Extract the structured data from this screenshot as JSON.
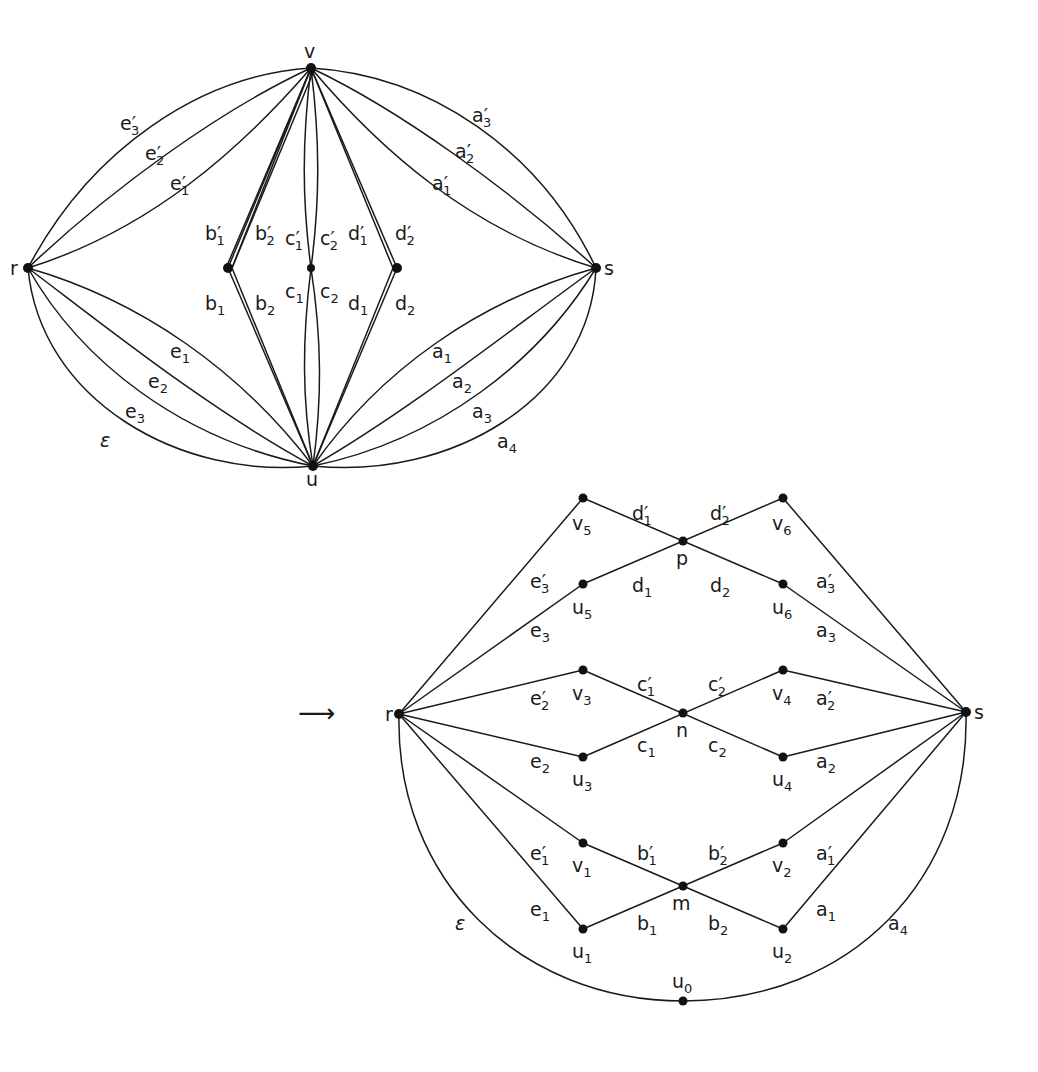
{
  "figure": {
    "left_graph": {
      "nodes": {
        "v": {
          "label": "v",
          "x": 311,
          "y": 68
        },
        "r": {
          "label": "r",
          "x": 28,
          "y": 268
        },
        "s": {
          "label": "s",
          "x": 596,
          "y": 268
        },
        "u": {
          "label": "u",
          "x": 313,
          "y": 466
        },
        "b": {
          "x": 228,
          "y": 268
        },
        "c": {
          "x": 311,
          "y": 268
        },
        "d": {
          "x": 397,
          "y": 268
        }
      },
      "edge_labels": [
        {
          "base": "e",
          "prime": true,
          "sub": "3",
          "x": 120,
          "y": 130
        },
        {
          "base": "e",
          "prime": true,
          "sub": "2",
          "x": 145,
          "y": 160
        },
        {
          "base": "e",
          "prime": true,
          "sub": "1",
          "x": 170,
          "y": 190
        },
        {
          "base": "a",
          "prime": true,
          "sub": "3",
          "x": 472,
          "y": 122
        },
        {
          "base": "a",
          "prime": true,
          "sub": "2",
          "x": 455,
          "y": 158
        },
        {
          "base": "a",
          "prime": true,
          "sub": "1",
          "x": 432,
          "y": 190
        },
        {
          "base": "b",
          "prime": true,
          "sub": "1",
          "x": 205,
          "y": 240
        },
        {
          "base": "b",
          "prime": true,
          "sub": "2",
          "x": 255,
          "y": 240
        },
        {
          "base": "c",
          "prime": true,
          "sub": "1",
          "x": 285,
          "y": 245
        },
        {
          "base": "c",
          "prime": true,
          "sub": "2",
          "x": 320,
          "y": 245
        },
        {
          "base": "d",
          "prime": true,
          "sub": "1",
          "x": 348,
          "y": 240
        },
        {
          "base": "d",
          "prime": true,
          "sub": "2",
          "x": 395,
          "y": 240
        },
        {
          "base": "b",
          "prime": false,
          "sub": "1",
          "x": 205,
          "y": 310
        },
        {
          "base": "b",
          "prime": false,
          "sub": "2",
          "x": 255,
          "y": 310
        },
        {
          "base": "c",
          "prime": false,
          "sub": "1",
          "x": 285,
          "y": 298
        },
        {
          "base": "c",
          "prime": false,
          "sub": "2",
          "x": 320,
          "y": 298
        },
        {
          "base": "d",
          "prime": false,
          "sub": "1",
          "x": 348,
          "y": 310
        },
        {
          "base": "d",
          "prime": false,
          "sub": "2",
          "x": 395,
          "y": 310
        },
        {
          "base": "e",
          "prime": false,
          "sub": "1",
          "x": 170,
          "y": 358
        },
        {
          "base": "e",
          "prime": false,
          "sub": "2",
          "x": 148,
          "y": 388
        },
        {
          "base": "e",
          "prime": false,
          "sub": "3",
          "x": 125,
          "y": 418
        },
        {
          "base": "ε",
          "prime": false,
          "sub": "",
          "x": 100,
          "y": 447
        },
        {
          "base": "a",
          "prime": false,
          "sub": "1",
          "x": 432,
          "y": 358
        },
        {
          "base": "a",
          "prime": false,
          "sub": "2",
          "x": 452,
          "y": 388
        },
        {
          "base": "a",
          "prime": false,
          "sub": "3",
          "x": 472,
          "y": 418
        },
        {
          "base": "a",
          "prime": false,
          "sub": "4",
          "x": 497,
          "y": 448
        }
      ]
    },
    "arrow": {
      "glyph": "⟶",
      "x": 298,
      "y": 722
    },
    "right_graph": {
      "nodes": [
        {
          "id": "r",
          "label": "r",
          "sub": "",
          "x": 399,
          "y": 714,
          "lx": 385,
          "ly": 721
        },
        {
          "id": "s",
          "label": "s",
          "sub": "",
          "x": 966,
          "y": 712,
          "lx": 974,
          "ly": 719
        },
        {
          "id": "v5",
          "label": "v",
          "sub": "5",
          "x": 583,
          "y": 498,
          "lx": 572,
          "ly": 530
        },
        {
          "id": "v6",
          "label": "v",
          "sub": "6",
          "x": 783,
          "y": 498,
          "lx": 772,
          "ly": 530
        },
        {
          "id": "p",
          "label": "p",
          "sub": "",
          "x": 683,
          "y": 541,
          "lx": 676,
          "ly": 565
        },
        {
          "id": "u5",
          "label": "u",
          "sub": "5",
          "x": 583,
          "y": 584,
          "lx": 572,
          "ly": 614
        },
        {
          "id": "u6",
          "label": "u",
          "sub": "6",
          "x": 783,
          "y": 584,
          "lx": 772,
          "ly": 614
        },
        {
          "id": "v3",
          "label": "v",
          "sub": "3",
          "x": 583,
          "y": 670,
          "lx": 572,
          "ly": 700
        },
        {
          "id": "v4",
          "label": "v",
          "sub": "4",
          "x": 783,
          "y": 670,
          "lx": 772,
          "ly": 700
        },
        {
          "id": "n",
          "label": "n",
          "sub": "",
          "x": 683,
          "y": 713,
          "lx": 676,
          "ly": 737
        },
        {
          "id": "u3",
          "label": "u",
          "sub": "3",
          "x": 583,
          "y": 757,
          "lx": 572,
          "ly": 786
        },
        {
          "id": "u4",
          "label": "u",
          "sub": "4",
          "x": 783,
          "y": 757,
          "lx": 772,
          "ly": 786
        },
        {
          "id": "v1",
          "label": "v",
          "sub": "1",
          "x": 583,
          "y": 843,
          "lx": 572,
          "ly": 872
        },
        {
          "id": "v2",
          "label": "v",
          "sub": "2",
          "x": 783,
          "y": 843,
          "lx": 772,
          "ly": 872
        },
        {
          "id": "m",
          "label": "m",
          "sub": "",
          "x": 683,
          "y": 886,
          "lx": 672,
          "ly": 910
        },
        {
          "id": "u1",
          "label": "u",
          "sub": "1",
          "x": 583,
          "y": 929,
          "lx": 572,
          "ly": 958
        },
        {
          "id": "u2",
          "label": "u",
          "sub": "2",
          "x": 783,
          "y": 929,
          "lx": 772,
          "ly": 958
        },
        {
          "id": "u0",
          "label": "u",
          "sub": "0",
          "x": 683,
          "y": 1001,
          "lx": 672,
          "ly": 988
        }
      ],
      "edge_labels": [
        {
          "base": "d",
          "prime": true,
          "sub": "1",
          "x": 632,
          "y": 520
        },
        {
          "base": "d",
          "prime": true,
          "sub": "2",
          "x": 710,
          "y": 520
        },
        {
          "base": "d",
          "prime": false,
          "sub": "1",
          "x": 632,
          "y": 592
        },
        {
          "base": "d",
          "prime": false,
          "sub": "2",
          "x": 710,
          "y": 592
        },
        {
          "base": "e",
          "prime": true,
          "sub": "3",
          "x": 530,
          "y": 588
        },
        {
          "base": "e",
          "prime": false,
          "sub": "3",
          "x": 530,
          "y": 637
        },
        {
          "base": "a",
          "prime": true,
          "sub": "3",
          "x": 816,
          "y": 588
        },
        {
          "base": "a",
          "prime": false,
          "sub": "3",
          "x": 816,
          "y": 637
        },
        {
          "base": "c",
          "prime": true,
          "sub": "1",
          "x": 637,
          "y": 691
        },
        {
          "base": "c",
          "prime": true,
          "sub": "2",
          "x": 708,
          "y": 691
        },
        {
          "base": "e",
          "prime": true,
          "sub": "2",
          "x": 530,
          "y": 705
        },
        {
          "base": "a",
          "prime": true,
          "sub": "2",
          "x": 816,
          "y": 705
        },
        {
          "base": "c",
          "prime": false,
          "sub": "1",
          "x": 637,
          "y": 752
        },
        {
          "base": "c",
          "prime": false,
          "sub": "2",
          "x": 708,
          "y": 752
        },
        {
          "base": "e",
          "prime": false,
          "sub": "2",
          "x": 530,
          "y": 768
        },
        {
          "base": "a",
          "prime": false,
          "sub": "2",
          "x": 816,
          "y": 768
        },
        {
          "base": "e",
          "prime": true,
          "sub": "1",
          "x": 530,
          "y": 860
        },
        {
          "base": "a",
          "prime": true,
          "sub": "1",
          "x": 816,
          "y": 860
        },
        {
          "base": "b",
          "prime": true,
          "sub": "1",
          "x": 637,
          "y": 860
        },
        {
          "base": "b",
          "prime": true,
          "sub": "2",
          "x": 708,
          "y": 860
        },
        {
          "base": "e",
          "prime": false,
          "sub": "1",
          "x": 530,
          "y": 916
        },
        {
          "base": "a",
          "prime": false,
          "sub": "1",
          "x": 816,
          "y": 916
        },
        {
          "base": "b",
          "prime": false,
          "sub": "1",
          "x": 637,
          "y": 930
        },
        {
          "base": "b",
          "prime": false,
          "sub": "2",
          "x": 708,
          "y": 930
        },
        {
          "base": "ε",
          "prime": false,
          "sub": "",
          "x": 455,
          "y": 930
        },
        {
          "base": "a",
          "prime": false,
          "sub": "4",
          "x": 888,
          "y": 930
        }
      ]
    }
  }
}
